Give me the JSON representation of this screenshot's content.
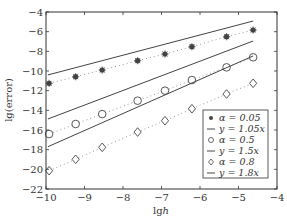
{
  "chart_data": {
    "type": "line",
    "title": "",
    "xlabel": "lgh",
    "ylabel": "lg(error)",
    "xlim": [
      -10,
      -4
    ],
    "ylim": [
      -22,
      -4
    ],
    "xticks": [
      -10,
      -9,
      -8,
      -7,
      -6,
      -5,
      -4
    ],
    "yticks": [
      -4,
      -6,
      -8,
      -10,
      -12,
      -14,
      -16,
      -18,
      -20,
      -22
    ],
    "grid": false,
    "legend_position": "lower right",
    "series": [
      {
        "name": "α=0.05",
        "kind": "marker",
        "marker": "asterisk",
        "linestyle": "dotted",
        "x": [
          -9.92,
          -9.23,
          -8.54,
          -7.62,
          -6.91,
          -6.21,
          -5.31,
          -4.62
        ],
        "y": [
          -11.25,
          -10.58,
          -9.9,
          -8.95,
          -8.27,
          -7.53,
          -6.51,
          -5.83
        ]
      },
      {
        "name": "y=1.05x",
        "kind": "reference-line",
        "linestyle": "solid",
        "x": [
          -9.95,
          -4.62
        ],
        "y": [
          -10.4,
          -4.92
        ]
      },
      {
        "name": "α=0.5",
        "kind": "marker",
        "marker": "circle",
        "linestyle": "dotted",
        "x": [
          -9.92,
          -9.23,
          -8.54,
          -7.62,
          -6.91,
          -6.21,
          -5.31,
          -4.62
        ],
        "y": [
          -16.41,
          -15.39,
          -14.38,
          -13.02,
          -12.0,
          -10.92,
          -9.63,
          -8.61
        ]
      },
      {
        "name": "y=1.5x",
        "kind": "reference-line",
        "linestyle": "solid",
        "x": [
          -9.95,
          -4.62
        ],
        "y": [
          -14.88,
          -6.95
        ]
      },
      {
        "name": "α=0.8",
        "kind": "marker",
        "marker": "diamond",
        "linestyle": "dotted",
        "x": [
          -9.92,
          -9.23,
          -8.54,
          -7.62,
          -6.91,
          -6.21,
          -5.31,
          -4.62
        ],
        "y": [
          -20.14,
          -18.98,
          -17.76,
          -16.21,
          -15.06,
          -13.84,
          -12.34,
          -11.25
        ]
      },
      {
        "name": "y=1.8x",
        "kind": "reference-line",
        "linestyle": "solid",
        "x": [
          -9.95,
          -4.62
        ],
        "y": [
          -17.7,
          -8.47
        ]
      }
    ]
  },
  "legend": {
    "items": [
      {
        "marker": "asterisk",
        "label": "α = 0.05"
      },
      {
        "marker": "line",
        "label": "y = 1.05x"
      },
      {
        "marker": "circle",
        "label": "α = 0.5"
      },
      {
        "marker": "line",
        "label": "y = 1.5x"
      },
      {
        "marker": "diamond",
        "label": "α = 0.8"
      },
      {
        "marker": "line",
        "label": "y = 1.8x"
      }
    ]
  },
  "colors": {
    "axis": "#333333",
    "line": "#444444",
    "marker": "#444444",
    "dotted": "#999999"
  }
}
